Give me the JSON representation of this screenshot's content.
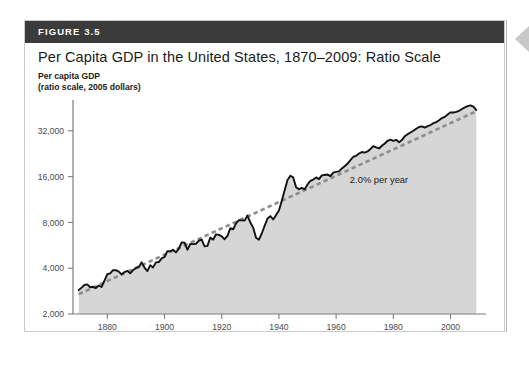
{
  "figure": {
    "label": "FIGURE 3.5",
    "title": "Per Capita GDP in the United States, 1870–2009: Ratio Scale",
    "axis_caption_line1": "Per capita GDP",
    "axis_caption_line2": "(ratio scale, 2005 dollars)",
    "header_color": "#3b3b3b",
    "border_color": "#c9c9c9"
  },
  "chart_data": {
    "type": "line",
    "title": "Per Capita GDP in the United States, 1870–2009: Ratio Scale",
    "xlabel": "Year",
    "ylabel": "Per capita GDP (ratio scale, 2005 dollars)",
    "yscale": "log",
    "ylim": [
      2000,
      48000
    ],
    "xlim": [
      1868,
      2011
    ],
    "ytick_labels": [
      "2,000",
      "4,000",
      "8,000",
      "16,000",
      "32,000"
    ],
    "ytick_values": [
      2000,
      4000,
      8000,
      16000,
      32000
    ],
    "xtick_labels": [
      "1880",
      "1900",
      "1920",
      "1940",
      "1960",
      "1980",
      "2000"
    ],
    "xtick_values": [
      1880,
      1900,
      1920,
      1940,
      1960,
      1980,
      2000
    ],
    "grid": false,
    "legend": "none",
    "annotations": [
      {
        "text": "2.0% per year",
        "x": 1975,
        "y": 14500
      }
    ],
    "series": [
      {
        "name": "Per capita GDP",
        "style": "solid",
        "color": "#111111",
        "fill": "#d6d6d6",
        "x": [
          1870,
          1871,
          1872,
          1873,
          1874,
          1875,
          1876,
          1877,
          1878,
          1879,
          1880,
          1881,
          1882,
          1883,
          1884,
          1885,
          1886,
          1887,
          1888,
          1889,
          1890,
          1891,
          1892,
          1893,
          1894,
          1895,
          1896,
          1897,
          1898,
          1899,
          1900,
          1901,
          1902,
          1903,
          1904,
          1905,
          1906,
          1907,
          1908,
          1909,
          1910,
          1911,
          1912,
          1913,
          1914,
          1915,
          1916,
          1917,
          1918,
          1919,
          1920,
          1921,
          1922,
          1923,
          1924,
          1925,
          1926,
          1927,
          1928,
          1929,
          1930,
          1931,
          1932,
          1933,
          1934,
          1935,
          1936,
          1937,
          1938,
          1939,
          1940,
          1941,
          1942,
          1943,
          1944,
          1945,
          1946,
          1947,
          1948,
          1949,
          1950,
          1951,
          1952,
          1953,
          1954,
          1955,
          1956,
          1957,
          1958,
          1959,
          1960,
          1961,
          1962,
          1963,
          1964,
          1965,
          1966,
          1967,
          1968,
          1969,
          1970,
          1971,
          1972,
          1973,
          1974,
          1975,
          1976,
          1977,
          1978,
          1979,
          1980,
          1981,
          1982,
          1983,
          1984,
          1985,
          1986,
          1987,
          1988,
          1989,
          1990,
          1991,
          1992,
          1993,
          1994,
          1995,
          1996,
          1997,
          1998,
          1999,
          2000,
          2001,
          2002,
          2003,
          2004,
          2005,
          2006,
          2007,
          2008,
          2009
        ],
        "y": [
          2870,
          2980,
          3100,
          3130,
          3000,
          3020,
          2960,
          3080,
          3010,
          3320,
          3650,
          3700,
          3880,
          3880,
          3800,
          3640,
          3770,
          3840,
          3700,
          3890,
          4000,
          4060,
          4370,
          4040,
          3830,
          4190,
          4050,
          4370,
          4390,
          4640,
          4740,
          5180,
          5170,
          5290,
          5080,
          5380,
          5900,
          5890,
          5290,
          5770,
          5760,
          5790,
          6070,
          6170,
          5570,
          5610,
          6360,
          6150,
          6680,
          6620,
          6470,
          6200,
          6520,
          7320,
          7210,
          7880,
          8280,
          8250,
          8220,
          8870,
          7990,
          7390,
          6340,
          6160,
          6760,
          7600,
          8480,
          8800,
          8370,
          8940,
          9580,
          11100,
          13000,
          15200,
          16200,
          15800,
          13600,
          13200,
          13500,
          13200,
          14200,
          15000,
          15300,
          15800,
          15400,
          16300,
          16400,
          16500,
          16100,
          17000,
          17200,
          17300,
          18100,
          18700,
          19500,
          20500,
          21600,
          21900,
          22700,
          23200,
          23000,
          23400,
          24300,
          25400,
          24900,
          24500,
          25500,
          26400,
          27500,
          28000,
          27500,
          27900,
          26900,
          27800,
          29500,
          30400,
          31200,
          32000,
          33000,
          33900,
          34200,
          33600,
          34300,
          34900,
          35900,
          36500,
          37500,
          38800,
          39500,
          41000,
          42300,
          42200,
          42600,
          43300,
          44500,
          45600,
          46500,
          47000,
          46200,
          43800
        ]
      },
      {
        "name": "2.0% per year trend",
        "style": "dashed",
        "color": "#8e8e8e",
        "x": [
          1870,
          2009
        ],
        "y": [
          2700,
          43000
        ],
        "growth_rate_pct": 2.0
      }
    ]
  },
  "edge_marker": {
    "name": "left-pointing-triangle",
    "color": "#c8c8c8"
  }
}
